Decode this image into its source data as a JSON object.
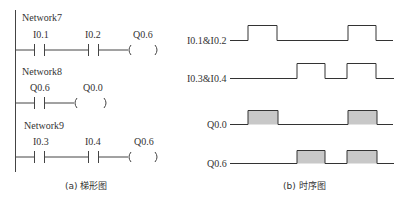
{
  "ladder": {
    "caption": "(a) 梯形图",
    "networks": [
      {
        "title": "Network7",
        "contacts": [
          "I0.1",
          "I0.2"
        ],
        "coil": "Q0.6"
      },
      {
        "title": "Network8",
        "contacts": [
          "Q0.6"
        ],
        "coil": "Q0.0"
      },
      {
        "title": "Network9",
        "contacts": [
          "I0.3",
          "I0.4"
        ],
        "coil": "Q0.6"
      }
    ]
  },
  "timing": {
    "caption": "(b) 时序图",
    "fill_color": "#c8c8c8",
    "signals": [
      {
        "label": "I0.1&I0.2",
        "filled": false,
        "pulses": [
          [
            248,
            277
          ],
          [
            348,
            376
          ]
        ]
      },
      {
        "label": "I0.3&I0.4",
        "filled": false,
        "pulses": [
          [
            297,
            325
          ],
          [
            347,
            376
          ]
        ]
      },
      {
        "label": "Q0.0",
        "filled": true,
        "pulses": [
          [
            248,
            278
          ],
          [
            348,
            377
          ]
        ]
      },
      {
        "label": "Q0.6",
        "filled": true,
        "pulses": [
          [
            297,
            325
          ],
          [
            347,
            377
          ]
        ]
      }
    ]
  }
}
